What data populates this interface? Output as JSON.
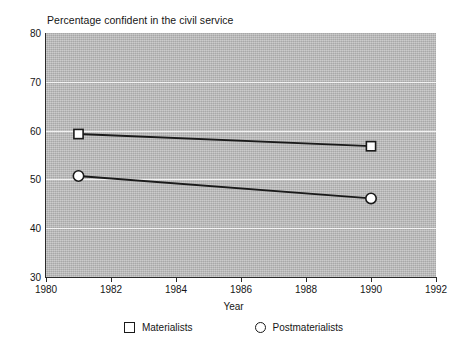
{
  "chart_data": {
    "type": "line",
    "title": "Percentage confident in the civil service",
    "xlabel": "Year",
    "ylabel": "",
    "x": [
      1981,
      1990
    ],
    "xlim": [
      1980,
      1992
    ],
    "ylim": [
      30,
      80
    ],
    "xticks": [
      "1980",
      "1982",
      "1984",
      "1986",
      "1988",
      "1990",
      "1992"
    ],
    "xtick_values": [
      1980,
      1982,
      1984,
      1986,
      1988,
      1990,
      1992
    ],
    "yticks": [
      "30",
      "40",
      "50",
      "60",
      "70",
      "80"
    ],
    "ytick_values": [
      30,
      40,
      50,
      60,
      70,
      80
    ],
    "grid": "horizontal-white",
    "legend_position": "below",
    "plot_background": "#b8b8b8",
    "line_color": "#1a1a1a",
    "marker_fill": "#ffffff",
    "series": [
      {
        "name": "Materialists",
        "marker": "square",
        "x": [
          1981,
          1990
        ],
        "values": [
          59.3,
          56.8
        ]
      },
      {
        "name": "Postmaterialists",
        "marker": "circle",
        "x": [
          1981,
          1990
        ],
        "values": [
          50.7,
          46.1
        ]
      }
    ]
  },
  "chart": {
    "title": "Percentage confident in the civil service",
    "x_axis_title": "Year"
  },
  "axis": {
    "y_labels": [
      "80",
      "70",
      "60",
      "50",
      "40",
      "30"
    ],
    "x_labels": [
      "1980",
      "1982",
      "1984",
      "1986",
      "1988",
      "1990",
      "1992"
    ]
  },
  "legend": {
    "items": [
      {
        "label": "Materialists",
        "marker": "square-marker-icon"
      },
      {
        "label": "Postmaterialists",
        "marker": "circle-marker-icon"
      }
    ]
  }
}
